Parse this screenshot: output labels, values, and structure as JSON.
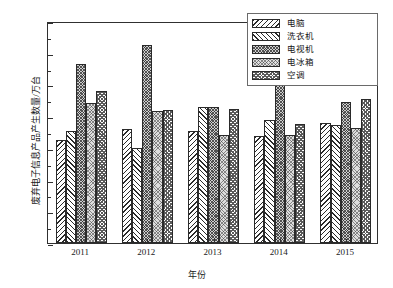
{
  "chart_data": {
    "type": "bar",
    "title": "",
    "xlabel": "年份",
    "ylabel": "废弃电子信息产品产生数量/万台",
    "categories": [
      "2011",
      "2012",
      "2013",
      "2014",
      "2015"
    ],
    "ylim": [
      0,
      35
    ],
    "yticks": [
      0,
      5,
      10,
      15,
      20,
      25,
      30,
      35
    ],
    "ytick_labels": [
      "0",
      "5",
      "10",
      "15",
      "20",
      "25",
      "30",
      "35"
    ],
    "y_minor_step": 2.5,
    "grid": false,
    "legend_position": "top-right",
    "series": [
      {
        "name": "电脑",
        "pattern": "backslash-hatch",
        "values": [
          16.3,
          17.9,
          17.7,
          16.9,
          18.9
        ]
      },
      {
        "name": "洗衣机",
        "pattern": "slash-hatch",
        "values": [
          17.6,
          15.0,
          21.5,
          19.4,
          18.6
        ]
      },
      {
        "name": "电视机",
        "pattern": "dense-dots",
        "values": [
          28.2,
          31.2,
          21.5,
          27.4,
          22.3
        ]
      },
      {
        "name": "电冰箱",
        "pattern": "light-dots",
        "values": [
          22.0,
          20.8,
          17.1,
          17.1,
          18.2
        ]
      },
      {
        "name": "空调",
        "pattern": "checker",
        "values": [
          24.0,
          21.0,
          21.1,
          18.7,
          22.7
        ]
      }
    ]
  },
  "legend": {
    "items": [
      {
        "label": "电脑"
      },
      {
        "label": "洗衣机"
      },
      {
        "label": "电视机"
      },
      {
        "label": "电冰箱"
      },
      {
        "label": "空调"
      }
    ]
  },
  "colors": {
    "axis": "#303030",
    "bar_edge": "#2a2a2a",
    "background": "#ffffff",
    "text": "#1a1a1a"
  }
}
